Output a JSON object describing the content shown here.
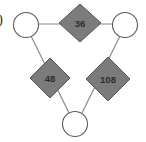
{
  "figure": {
    "type": "graph-diagram",
    "background_color": "#ffffff",
    "width": 146,
    "height": 142,
    "corner_marker": ")"
  },
  "style": {
    "edge_color": "#8a8a8a",
    "node_fill": "#ffffff",
    "node_stroke": "#5a5a5a",
    "diamond_fill": "#7b7b7b",
    "diamond_stroke": "#555555",
    "diamond_text_color": "#2b2b2b"
  },
  "nodes": [
    {
      "id": "top-left",
      "label": "",
      "cx": 26,
      "cy": 25,
      "r": 12
    },
    {
      "id": "top-right",
      "label": "",
      "cx": 125,
      "cy": 25,
      "r": 12
    },
    {
      "id": "bottom",
      "label": "",
      "cx": 75,
      "cy": 124,
      "r": 12
    }
  ],
  "edges": [
    {
      "id": "edge-top",
      "from": "top-left",
      "to": "top-right",
      "label": "36",
      "lx": 80,
      "ly": 21
    },
    {
      "id": "edge-left",
      "from": "top-left",
      "to": "bottom",
      "label": "48",
      "lx": 50,
      "ly": 77
    },
    {
      "id": "edge-right",
      "from": "top-right",
      "to": "bottom",
      "label": "108",
      "lx": 108,
      "ly": 78
    }
  ],
  "labels": {
    "top": "36",
    "left": "48",
    "right": "108"
  }
}
